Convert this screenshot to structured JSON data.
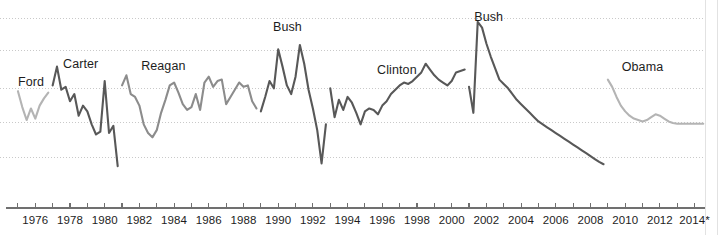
{
  "chart_data": {
    "type": "line",
    "title": "",
    "subtitle": "",
    "xlabel": "",
    "ylabel": "",
    "grid": true,
    "grid_style": "dotted-horizontal",
    "legend_position": "inline-annotations",
    "xlim": [
      1974.6,
      2014.6
    ],
    "ylim": [
      -1.2,
      5.0
    ],
    "x_tick_step": 1,
    "x_label_step": 2,
    "x_tick_labels": [
      "1976",
      "1978",
      "1980",
      "1982",
      "1984",
      "1986",
      "1988",
      "1990",
      "1992",
      "1994",
      "1996",
      "1998",
      "2000",
      "2002",
      "2004",
      "2006",
      "2008",
      "2010",
      "2012",
      "2014*"
    ],
    "x_tick_label_years": [
      1976,
      1978,
      1980,
      1982,
      1984,
      1986,
      1988,
      1990,
      1992,
      1994,
      1996,
      1998,
      2000,
      2002,
      2004,
      2006,
      2008,
      2010,
      2012,
      2014
    ],
    "x_minor_tick_years": [
      1975,
      1976,
      1977,
      1978,
      1979,
      1980,
      1981,
      1982,
      1983,
      1984,
      1985,
      1986,
      1987,
      1988,
      1989,
      1990,
      1991,
      1992,
      1993,
      1994,
      1995,
      1996,
      1997,
      1998,
      1999,
      2000,
      2001,
      2002,
      2003,
      2004,
      2005,
      2006,
      2007,
      2008,
      2009,
      2010,
      2011,
      2012,
      2013,
      2014
    ],
    "gridline_values": [
      4.55,
      3.45,
      2.15,
      0.95,
      -0.25
    ],
    "annotations": [
      {
        "text": "Ford",
        "x_year": 1975.0,
        "y_value": 2.35
      },
      {
        "text": "Carter",
        "x_year": 1977.6,
        "y_value": 2.95
      },
      {
        "text": "Reagan",
        "x_year": 1982.1,
        "y_value": 2.9
      },
      {
        "text": "Bush",
        "x_year": 1989.7,
        "y_value": 4.25
      },
      {
        "text": "Clinton",
        "x_year": 1995.7,
        "y_value": 2.75
      },
      {
        "text": "Bush",
        "x_year": 2001.3,
        "y_value": 4.6
      },
      {
        "text": "Obama",
        "x_year": 2009.8,
        "y_value": 2.85
      }
    ],
    "series": [
      {
        "name": "Ford",
        "color": "#b4b4b4",
        "x": [
          1975.0,
          1975.25,
          1975.5,
          1975.75,
          1976.0,
          1976.25,
          1976.5,
          1976.75
        ],
        "values": [
          2.05,
          1.5,
          1.05,
          1.45,
          1.1,
          1.55,
          1.8,
          2.0
        ]
      },
      {
        "name": "Carter",
        "color": "#585858",
        "x": [
          1977.0,
          1977.25,
          1977.5,
          1977.75,
          1978.0,
          1978.25,
          1978.5,
          1978.75,
          1979.0,
          1979.25,
          1979.5,
          1979.75,
          1980.0,
          1980.25,
          1980.5,
          1980.75
        ],
        "values": [
          2.25,
          2.9,
          2.1,
          2.2,
          1.7,
          1.95,
          1.2,
          1.55,
          1.35,
          0.9,
          0.55,
          0.65,
          2.4,
          0.6,
          0.85,
          -0.55
        ]
      },
      {
        "name": "Reagan",
        "color": "#8c8c8c",
        "x": [
          1981.0,
          1981.25,
          1981.5,
          1981.75,
          1982.0,
          1982.25,
          1982.5,
          1982.75,
          1983.0,
          1983.25,
          1983.5,
          1983.75,
          1984.0,
          1984.25,
          1984.5,
          1984.75,
          1985.0,
          1985.25,
          1985.5,
          1985.75,
          1986.0,
          1986.25,
          1986.5,
          1986.75,
          1987.0,
          1987.25,
          1987.5,
          1987.75,
          1988.0,
          1988.25,
          1988.5,
          1988.75
        ],
        "values": [
          2.25,
          2.6,
          1.95,
          1.85,
          1.55,
          0.9,
          0.6,
          0.45,
          0.7,
          1.3,
          1.75,
          2.25,
          2.35,
          2.0,
          1.6,
          1.4,
          1.5,
          1.95,
          1.4,
          2.35,
          2.55,
          2.2,
          2.4,
          2.45,
          1.6,
          1.85,
          2.1,
          2.35,
          2.2,
          2.25,
          1.7,
          1.45
        ]
      },
      {
        "name": "Bush",
        "color": "#585858",
        "x": [
          1989.0,
          1989.25,
          1989.5,
          1989.75,
          1990.0,
          1990.25,
          1990.5,
          1990.75,
          1991.0,
          1991.25,
          1991.5,
          1991.75,
          1992.0,
          1992.25,
          1992.5,
          1992.75
        ],
        "values": [
          1.35,
          1.85,
          2.4,
          2.15,
          3.5,
          2.9,
          2.25,
          1.95,
          2.55,
          3.65,
          3.0,
          2.1,
          1.45,
          0.7,
          -0.45,
          0.9
        ]
      },
      {
        "name": "Clinton",
        "color": "#585858",
        "x": [
          1993.0,
          1993.25,
          1993.5,
          1993.75,
          1994.0,
          1994.25,
          1994.5,
          1994.75,
          1995.0,
          1995.25,
          1995.5,
          1995.75,
          1996.0,
          1996.25,
          1996.5,
          1996.75,
          1997.0,
          1997.25,
          1997.5,
          1997.75,
          1998.0,
          1998.25,
          1998.5,
          1998.75,
          1999.0,
          1999.25,
          1999.5,
          1999.75,
          2000.0,
          2000.25,
          2000.5,
          2000.75
        ],
        "values": [
          2.15,
          1.15,
          1.75,
          1.4,
          1.85,
          1.65,
          1.3,
          0.9,
          1.35,
          1.45,
          1.4,
          1.25,
          1.55,
          1.7,
          1.95,
          2.1,
          2.25,
          2.35,
          2.3,
          2.4,
          2.55,
          2.7,
          3.0,
          2.8,
          2.6,
          2.45,
          2.35,
          2.25,
          2.4,
          2.7,
          2.75,
          2.8
        ]
      },
      {
        "name": "Bush",
        "color": "#585858",
        "x": [
          2001.0,
          2001.25,
          2001.5,
          2001.75,
          2002.0,
          2002.25,
          2002.5,
          2002.75,
          2003.0,
          2003.25,
          2003.5,
          2003.75,
          2004.0,
          2004.25,
          2004.5,
          2004.75,
          2005.0,
          2005.25,
          2005.5,
          2005.75,
          2006.0,
          2006.25,
          2006.5,
          2006.75,
          2007.0,
          2007.25,
          2007.5,
          2007.75,
          2008.0,
          2008.25,
          2008.5,
          2008.75
        ],
        "values": [
          2.2,
          1.3,
          4.45,
          4.25,
          3.7,
          3.25,
          2.85,
          2.45,
          2.3,
          2.15,
          1.95,
          1.75,
          1.6,
          1.45,
          1.3,
          1.15,
          1.0,
          0.9,
          0.8,
          0.7,
          0.6,
          0.5,
          0.4,
          0.3,
          0.2,
          0.1,
          0.0,
          -0.1,
          -0.2,
          -0.3,
          -0.4,
          -0.48
        ]
      },
      {
        "name": "Obama",
        "color": "#b4b4b4",
        "x": [
          2009.0,
          2009.25,
          2009.5,
          2009.75,
          2010.0,
          2010.25,
          2010.5,
          2010.75,
          2011.0,
          2011.25,
          2011.5,
          2011.75,
          2012.0,
          2012.25,
          2012.5,
          2012.75,
          2013.0,
          2013.25,
          2013.5,
          2013.75,
          2014.0,
          2014.25,
          2014.5
        ],
        "values": [
          2.45,
          2.2,
          1.85,
          1.55,
          1.35,
          1.2,
          1.1,
          1.05,
          1.0,
          1.05,
          1.15,
          1.25,
          1.2,
          1.1,
          1.0,
          0.95,
          0.92,
          0.92,
          0.92,
          0.92,
          0.92,
          0.92,
          0.92
        ]
      }
    ]
  },
  "axis": {
    "line_color": "#707070",
    "tick_color": "#707070"
  },
  "style": {
    "background": "#ffffff",
    "gridline_color": "#c9c9c9",
    "label_color": "#1d1d1d",
    "dark_series": "#585858",
    "mid_series": "#8c8c8c",
    "light_series": "#b4b4b4"
  }
}
